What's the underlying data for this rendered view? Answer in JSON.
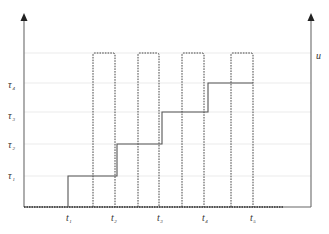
{
  "figure": {
    "type": "timing-diagram",
    "left_axis_label": "",
    "right_axis_label": "u",
    "y_levels": [
      {
        "label": "τ",
        "sub": "1",
        "y": 176
      },
      {
        "label": "τ",
        "sub": "2",
        "y": 144
      },
      {
        "label": "τ",
        "sub": "3",
        "y": 112
      },
      {
        "label": "τ",
        "sub": "4",
        "y": 83
      }
    ],
    "time_ticks": [
      {
        "label": "t",
        "sub": "1",
        "x": 68
      },
      {
        "label": "t",
        "sub": "2",
        "x": 115
      },
      {
        "label": "t",
        "sub": "3",
        "x": 160
      },
      {
        "label": "t",
        "sub": "4",
        "x": 205
      },
      {
        "label": "t",
        "sub": "5",
        "x": 253
      }
    ],
    "pulses": [
      {
        "x1": 93,
        "x2": 115
      },
      {
        "x1": 138,
        "x2": 159
      },
      {
        "x1": 182,
        "x2": 204
      },
      {
        "x1": 231,
        "x2": 253
      }
    ],
    "pulse_top_y": 53,
    "baseline_y": 207,
    "staircase": [
      {
        "from_x": 68,
        "to_x": 117,
        "level": "τ1"
      },
      {
        "from_x": 117,
        "to_x": 162,
        "level": "τ2"
      },
      {
        "from_x": 162,
        "to_x": 208,
        "level": "τ3"
      },
      {
        "from_x": 208,
        "to_x": 253,
        "level": "τ4"
      }
    ],
    "colors": {
      "axis": "#777777",
      "step_line": "#555555",
      "pulse_line": "#444444",
      "grid": "#e4e4e4",
      "text": "#333333"
    }
  }
}
